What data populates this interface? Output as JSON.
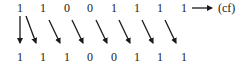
{
  "diagram": {
    "top_row": [
      "1",
      "1",
      "0",
      "0",
      "1",
      "1",
      "1",
      "1"
    ],
    "bottom_row": [
      "1",
      "1",
      "1",
      "0",
      "0",
      "1",
      "1",
      "1"
    ],
    "carry_label": "(cf)",
    "colors": {
      "ink": "#1a1a1a",
      "background": "#ffffff"
    }
  }
}
